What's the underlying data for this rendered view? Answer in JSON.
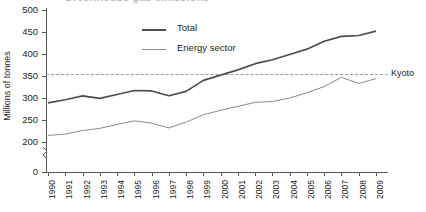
{
  "title_partial": "Greenhouse gas emissions",
  "legend": {
    "position": "top-center",
    "items": [
      {
        "label": "Total",
        "color": "#4d4d4f",
        "width": 2
      },
      {
        "label": "Energy sector",
        "color": "#8b8b90",
        "width": 1
      }
    ]
  },
  "annotations": [
    {
      "name": "kyoto",
      "label": "Kyoto",
      "value": 355,
      "style": "dashed",
      "color": "#9a9a9f"
    }
  ],
  "axes": {
    "y_title": "Millions of tonnes",
    "y_ticks": [
      "500",
      "450",
      "400",
      "350",
      "300",
      "250",
      "200",
      "0"
    ],
    "x_ticks": [
      "1990",
      "1991",
      "1992",
      "1993",
      "1994",
      "1995",
      "1996",
      "1997",
      "1998",
      "1999",
      "2000",
      "2001",
      "2002",
      "2003",
      "2004",
      "2005",
      "2006",
      "2007",
      "2008",
      "2009"
    ],
    "axis_break": true
  },
  "chart_data": {
    "type": "line",
    "title": "Greenhouse gas emissions",
    "xlabel": "",
    "ylabel": "Millions of tonnes",
    "ylim": [
      190,
      500
    ],
    "ytick_values": [
      500,
      450,
      400,
      350,
      300,
      250,
      200,
      0
    ],
    "grid": false,
    "legend_position": "top-center",
    "axis_break_between": [
      0,
      200
    ],
    "x": [
      1990,
      1991,
      1992,
      1993,
      1994,
      1995,
      1996,
      1997,
      1998,
      1999,
      2000,
      2001,
      2002,
      2003,
      2004,
      2005,
      2006,
      2007,
      2008,
      2009
    ],
    "series": [
      {
        "name": "Total",
        "color": "#4d4d4f",
        "values": [
          289,
          296,
          305,
          299,
          308,
          317,
          316,
          305,
          315,
          340,
          352,
          364,
          378,
          387,
          399,
          411,
          429,
          440,
          442,
          452
        ]
      },
      {
        "name": "Energy sector",
        "color": "#8b8b90",
        "values": [
          215,
          218,
          226,
          231,
          240,
          248,
          243,
          232,
          245,
          262,
          272,
          281,
          290,
          292,
          300,
          312,
          326,
          347,
          333,
          344
        ]
      }
    ],
    "reference_lines": [
      {
        "label": "Kyoto",
        "y": 355,
        "style": "dashed"
      }
    ]
  }
}
